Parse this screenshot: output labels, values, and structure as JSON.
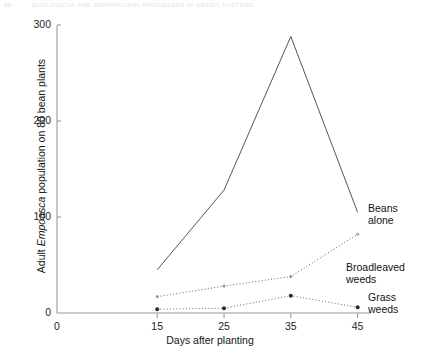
{
  "page_header": {
    "folio": "86",
    "running_title": "ECOLOGICAL AND BEHAVIOURAL PROCESSES IN WEEDY SYSTEMS"
  },
  "chart_data": {
    "type": "line",
    "title": "",
    "xlabel": "Days after planting",
    "ylabel": "Adult Empoasca population on 80 bean plants",
    "ylabel_parts": {
      "prefix": "Adult ",
      "italic": "Empoasca",
      "suffix": " population on 80 bean plants"
    },
    "x": [
      15,
      25,
      35,
      45
    ],
    "xlim": [
      0,
      47
    ],
    "ylim": [
      0,
      310
    ],
    "xticks": [
      0,
      15,
      25,
      35,
      45
    ],
    "xtick_labels": [
      "0",
      "15",
      "25",
      "35",
      "45"
    ],
    "yticks": [
      0,
      100,
      200,
      300
    ],
    "ytick_labels": [
      "0",
      "100",
      "200",
      "300"
    ],
    "grid": false,
    "legend_position": "right-inline",
    "series": [
      {
        "name": "Beans alone",
        "label_lines": [
          "Beans",
          "alone"
        ],
        "style": "solid",
        "marker": "none",
        "color": "#555555",
        "values": [
          45,
          128,
          288,
          105
        ]
      },
      {
        "name": "Broadleaved weeds",
        "label_lines": [
          "Broadleaved",
          "weeds"
        ],
        "style": "dotted",
        "marker": "none",
        "color": "#6a6a6a",
        "values": [
          17,
          28,
          38,
          82
        ]
      },
      {
        "name": "Grass weeds",
        "label_lines": [
          "Grass",
          "weeds"
        ],
        "style": "dotted",
        "marker": "dot",
        "color": "#6a6a6a",
        "values": [
          4,
          5,
          18,
          6
        ]
      }
    ]
  }
}
